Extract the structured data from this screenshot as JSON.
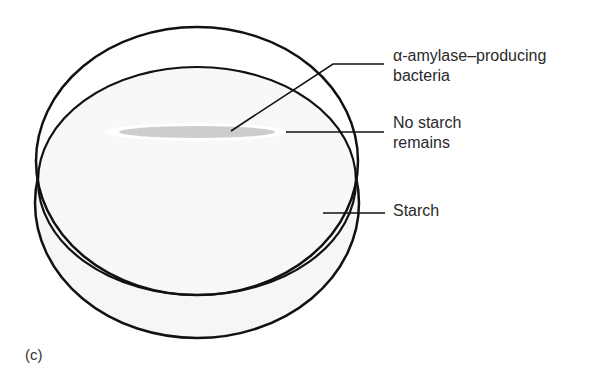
{
  "figure": {
    "panel_label": "(c)",
    "labels": {
      "bacteria_line1": "α-amylase–producing",
      "bacteria_line2": "bacteria",
      "no_starch_line1": "No starch",
      "no_starch_line2": "remains",
      "starch": "Starch"
    },
    "colors": {
      "outline": "#111111",
      "agar": "#f7f7f7",
      "colony": "#cfcfcf",
      "clear_zone": "#ffffff"
    }
  }
}
